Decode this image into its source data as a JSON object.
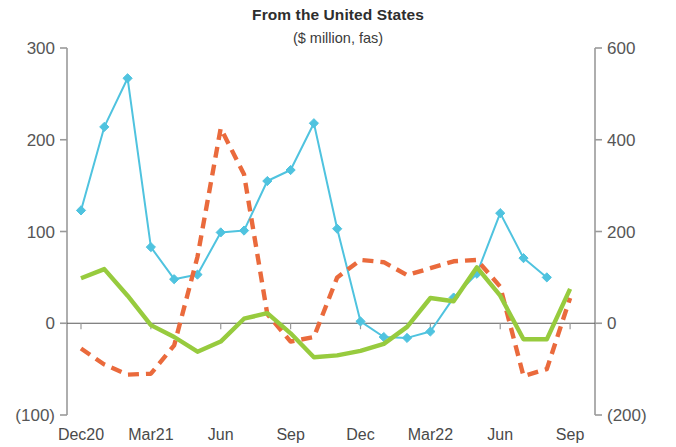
{
  "chart_data": {
    "type": "line",
    "title": "From the United States",
    "subtitle": "($ million, fas)",
    "xlabel": "",
    "ylabel": "",
    "grid": false,
    "legend_position": "none",
    "x": [
      "Dec20",
      "Jan21",
      "Feb21",
      "Mar21",
      "Apr21",
      "May21",
      "Jun21",
      "Jul21",
      "Aug21",
      "Sep21",
      "Oct21",
      "Nov21",
      "Dec21",
      "Jan22",
      "Feb22",
      "Mar22",
      "Apr22",
      "May22",
      "Jun22",
      "Jul22",
      "Aug22",
      "Sep22"
    ],
    "xtick_labels": [
      "Dec20",
      "Mar21",
      "Jun",
      "Sep",
      "Dec",
      "Mar22",
      "Jun",
      "Sep"
    ],
    "xtick_index": [
      0,
      3,
      6,
      9,
      12,
      15,
      18,
      21
    ],
    "left_axis": {
      "ticks": [
        300,
        200,
        100,
        0,
        -100
      ],
      "tick_labels": [
        "300",
        "200",
        "100",
        "0",
        "(100)"
      ],
      "ylim": [
        -100,
        300
      ]
    },
    "right_axis": {
      "ticks": [
        600,
        400,
        200,
        0,
        -200
      ],
      "tick_labels": [
        "600",
        "400",
        "200",
        "0",
        "(200)"
      ],
      "ylim": [
        -200,
        600
      ]
    },
    "series": [
      {
        "name": "blue-series",
        "axis": "left",
        "color": "#4FC3DF",
        "style": "solid",
        "markers": true,
        "marker_shape": "diamond",
        "values": [
          123,
          214,
          267,
          83,
          48,
          53,
          99,
          101,
          155,
          167,
          218,
          103,
          2,
          -15,
          -16,
          -9,
          28,
          54,
          120,
          71,
          50,
          null
        ]
      },
      {
        "name": "orange-series",
        "axis": "right",
        "color": "#EA6A3C",
        "style": "dashed",
        "markers": false,
        "values": [
          -55,
          -90,
          -112,
          -110,
          -48,
          145,
          425,
          325,
          20,
          -40,
          -30,
          100,
          138,
          133,
          105,
          120,
          135,
          138,
          80,
          -115,
          -100,
          55
        ]
      },
      {
        "name": "green-series",
        "axis": "right",
        "color": "#97CB3E",
        "style": "solid",
        "markers": false,
        "values": [
          98,
          118,
          60,
          -4,
          -30,
          -62,
          -40,
          10,
          22,
          -22,
          -74,
          -70,
          -60,
          -45,
          -8,
          55,
          48,
          122,
          60,
          -35,
          -35,
          75
        ]
      }
    ]
  },
  "axis_colors": {
    "spine": "#9a9a9a",
    "zero_line": "#5a5a5a",
    "tick_text": "#565656"
  }
}
